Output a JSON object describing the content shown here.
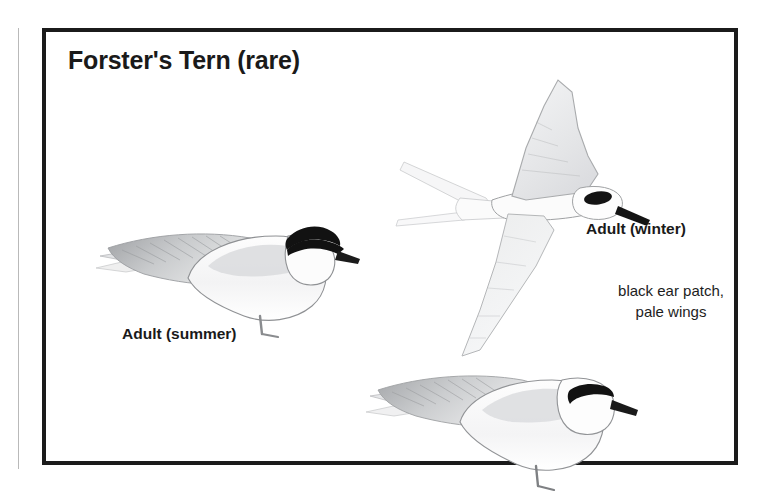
{
  "plate": {
    "title": "Forster's Tern (rare)",
    "border_color": "#1b1b1b",
    "background_color": "#ffffff"
  },
  "captions": {
    "summer": "Adult (summer)",
    "winter": "Adult (winter)"
  },
  "field_marks": {
    "line1": "black ear patch,",
    "line2": "pale wings"
  },
  "illustrations": [
    {
      "name": "adult-summer-perched",
      "pose": "perched, facing right",
      "plumage": "black cap from bill over crown to nape, pale gray back and wings, white underparts, long pointed wing tips and tail extending left, thin gray legs",
      "cap_color": "#111111",
      "body_color": "#f2f2f3",
      "wing_color": "#d8d9db"
    },
    {
      "name": "adult-winter-flying",
      "pose": "in flight, seen from the side with wings raised and lowered",
      "plumage": "black ear patch behind eye, white head and body, very pale gray wings, deeply forked tail with long streamers, black bill",
      "ear_patch_color": "#111111",
      "body_color": "#fafafa",
      "wing_color": "#e9eaec"
    },
    {
      "name": "adult-winter-perched",
      "pose": "perched, facing right",
      "plumage": "white crown with isolated black ear patch through eye, black bill, pale gray mantle and wings, white underparts",
      "ear_patch_color": "#111111",
      "body_color": "#f4f4f5",
      "wing_color": "#d7d8da"
    }
  ]
}
